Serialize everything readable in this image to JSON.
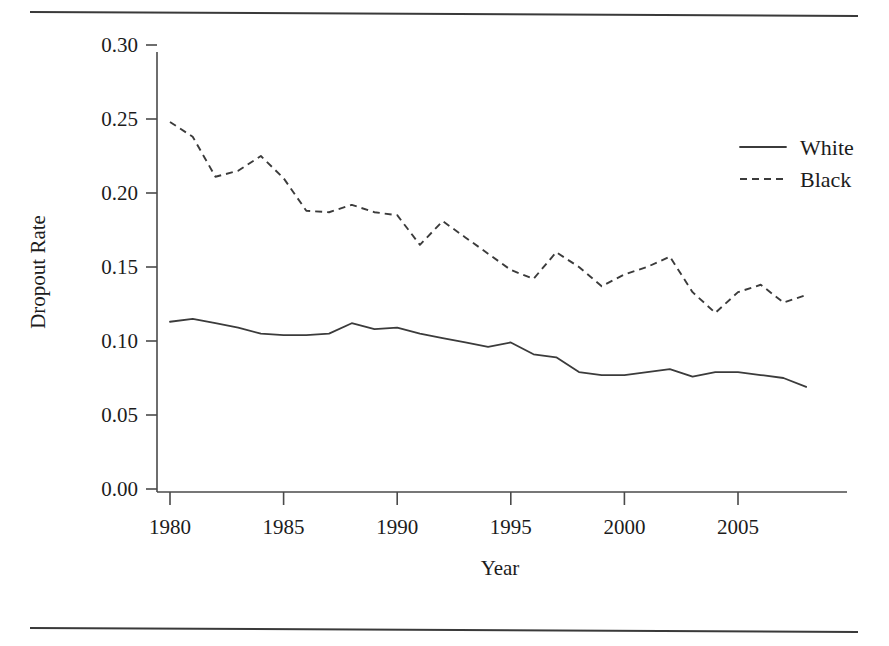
{
  "figure": {
    "has_top_rule": true,
    "has_bottom_rule": true,
    "background_color": "#ffffff",
    "ink_color": "#3b3b3b"
  },
  "chart_data": {
    "type": "line",
    "title": "",
    "xlabel": "Year",
    "ylabel": "Dropout Rate",
    "xlim": [
      1979,
      2009
    ],
    "ylim": [
      0.0,
      0.315
    ],
    "grid": false,
    "legend_position": "top-right",
    "xticks": [
      1980,
      1985,
      1990,
      1995,
      2000,
      2005
    ],
    "xtick_labels": [
      "1980",
      "1985",
      "1990",
      "1995",
      "2000",
      "2005"
    ],
    "yticks": [
      0.0,
      0.05,
      0.1,
      0.15,
      0.2,
      0.25,
      0.3
    ],
    "ytick_labels": [
      "0.00",
      "0.05",
      "0.10",
      "0.15",
      "0.20",
      "0.25",
      "0.30"
    ],
    "x": [
      1980,
      1981,
      1982,
      1983,
      1984,
      1985,
      1986,
      1987,
      1988,
      1989,
      1990,
      1991,
      1992,
      1993,
      1994,
      1995,
      1996,
      1997,
      1998,
      1999,
      2000,
      2001,
      2002,
      2003,
      2004,
      2005,
      2006,
      2007,
      2008
    ],
    "series": [
      {
        "name": "White",
        "style": "solid",
        "color": "#3b3b3b",
        "values": [
          0.113,
          0.115,
          0.112,
          0.109,
          0.105,
          0.104,
          0.104,
          0.105,
          0.112,
          0.108,
          0.109,
          0.105,
          0.102,
          0.099,
          0.096,
          0.099,
          0.091,
          0.089,
          0.079,
          0.077,
          0.077,
          0.079,
          0.081,
          0.076,
          0.079,
          0.079,
          0.077,
          0.075,
          0.069
        ]
      },
      {
        "name": "Black",
        "style": "dashed",
        "color": "#3b3b3b",
        "values": [
          0.248,
          0.238,
          0.211,
          0.215,
          0.225,
          0.21,
          0.188,
          0.187,
          0.192,
          0.187,
          0.185,
          0.165,
          0.181,
          0.17,
          0.159,
          0.148,
          0.142,
          0.16,
          0.15,
          0.137,
          0.145,
          0.15,
          0.157,
          0.133,
          0.119,
          0.133,
          0.138,
          0.126,
          0.131
        ]
      }
    ],
    "legend": [
      {
        "label": "White",
        "style": "solid"
      },
      {
        "label": "Black",
        "style": "dashed"
      }
    ]
  }
}
